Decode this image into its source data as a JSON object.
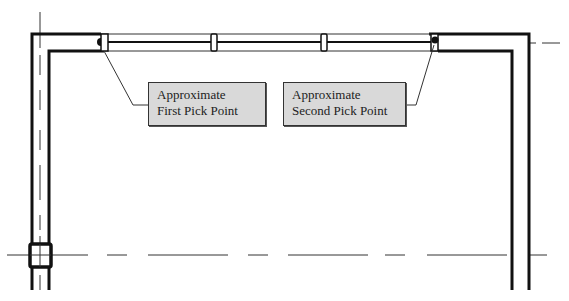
{
  "diagram": {
    "type": "architectural-floor-plan-detail",
    "callouts": [
      {
        "id": "first",
        "line1": "Approximate",
        "line2": "First Pick Point",
        "points_to": "left end of window"
      },
      {
        "id": "second",
        "line1": "Approximate",
        "line2": "Second Pick Point",
        "points_to": "right end of window"
      }
    ],
    "colors": {
      "wall_line": "#111111",
      "centerline": "#333333",
      "callout_fill": "#d9d9d9",
      "callout_border": "#333333",
      "background": "#ffffff"
    }
  }
}
